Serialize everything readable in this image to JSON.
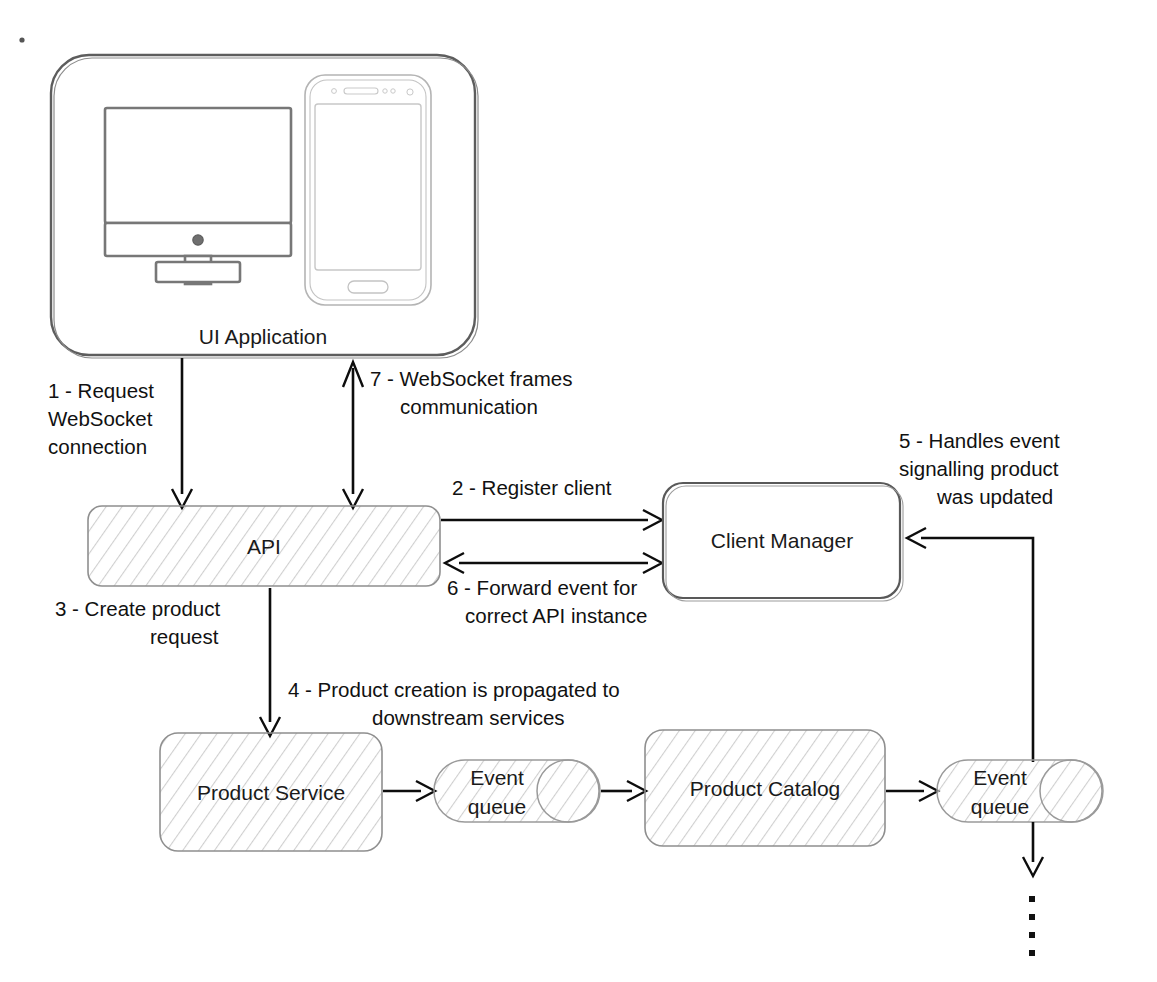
{
  "diagram": {
    "nodes": [
      {
        "id": "ui-application",
        "label": "UI Application",
        "shape": "rounded-container",
        "style": "plain"
      },
      {
        "id": "api",
        "label": "API",
        "shape": "rounded-rect",
        "style": "hatched"
      },
      {
        "id": "client-manager",
        "label": "Client Manager",
        "shape": "rounded-rect",
        "style": "plain"
      },
      {
        "id": "product-service",
        "label": "Product Service",
        "shape": "rounded-rect",
        "style": "hatched"
      },
      {
        "id": "event-queue-1",
        "label_line1": "Event",
        "label_line2": "queue",
        "shape": "cylinder",
        "style": "hatched"
      },
      {
        "id": "product-catalog",
        "label": "Product Catalog",
        "shape": "rounded-rect",
        "style": "hatched"
      },
      {
        "id": "event-queue-2",
        "label_line1": "Event",
        "label_line2": "queue",
        "shape": "cylinder",
        "style": "hatched"
      }
    ],
    "icons": [
      {
        "id": "desktop-monitor-icon",
        "name": "desktop-monitor-icon"
      },
      {
        "id": "mobile-phone-icon",
        "name": "mobile-phone-icon"
      }
    ],
    "flows": [
      {
        "step": "1",
        "label_lines": [
          "1 - Request",
          "WebSocket",
          "connection"
        ],
        "from": "ui-application",
        "to": "api",
        "direction": "one-way"
      },
      {
        "step": "7",
        "label_lines": [
          "7 - WebSocket frames",
          "communication"
        ],
        "from": "api",
        "to": "ui-application",
        "direction": "two-way"
      },
      {
        "step": "2",
        "label_lines": [
          "2 - Register client"
        ],
        "from": "api",
        "to": "client-manager",
        "direction": "one-way"
      },
      {
        "step": "6",
        "label_lines": [
          "6 - Forward event for",
          "correct API instance"
        ],
        "from": "client-manager",
        "to": "api",
        "direction": "two-way"
      },
      {
        "step": "3",
        "label_lines": [
          "3 - Create product",
          "request"
        ],
        "from": "api",
        "to": "product-service",
        "direction": "one-way"
      },
      {
        "step": "4",
        "label_lines": [
          "4 - Product creation is propagated to",
          "downstream services"
        ],
        "from": "product-service",
        "to": "product-catalog",
        "direction": "one-way"
      },
      {
        "step": "5",
        "label_lines": [
          "5 - Handles event",
          "signalling product",
          "was updated"
        ],
        "from": "event-queue-2",
        "to": "client-manager",
        "direction": "one-way"
      }
    ],
    "continuation": {
      "name": "ellipsis-dots",
      "dot_count": 4
    },
    "colors": {
      "background": "#ffffff",
      "stroke": "#0d0d0d",
      "shape_outline": "#6e6e6e",
      "hatch": "#bdbdbd",
      "text": "#111111"
    }
  }
}
